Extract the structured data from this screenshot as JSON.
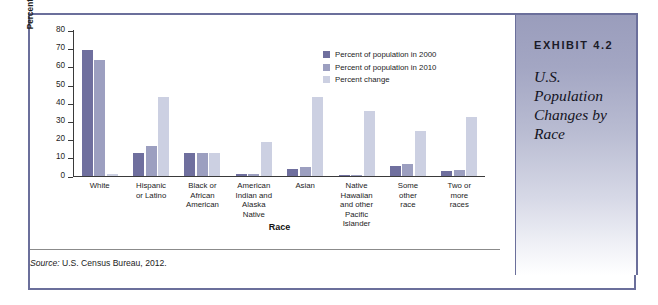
{
  "exhibit": {
    "number": "EXHIBIT 4.2",
    "title": "U.S. Population Changes by Race"
  },
  "source": {
    "keyword": "Source:",
    "text": " U.S. Census Bureau, 2012."
  },
  "colors": {
    "series_2000": "#6f6f9e",
    "series_2010": "#9c9fc0",
    "series_change": "#ccd0e2",
    "frame_border": "#6b6f9b",
    "panel_top": "#9a9dbc",
    "axis": "#3a3a3a"
  },
  "chart_data": {
    "type": "bar",
    "title": "",
    "xlabel": "Race",
    "ylabel": "Percentage of population",
    "ylim": [
      0,
      80
    ],
    "yticks": [
      0,
      10,
      20,
      30,
      40,
      50,
      60,
      70,
      80
    ],
    "grid": false,
    "legend_position": "upper-right-inside",
    "categories": [
      "White",
      "Hispanic or Latino",
      "Black or African American",
      "American Indian and Alaska Native",
      "Asian",
      "Native Hawaiian and other Pacific Islander",
      "Some other race",
      "Two or more races"
    ],
    "category_lines": [
      [
        "White"
      ],
      [
        "Hispanic",
        "or Latino"
      ],
      [
        "Black or",
        "African",
        "American"
      ],
      [
        "American",
        "Indian and",
        "Alaska",
        "Native"
      ],
      [
        "Asian"
      ],
      [
        "Native",
        "Hawaiian",
        "and other",
        "Pacific",
        "Islander"
      ],
      [
        "Some",
        "other",
        "race"
      ],
      [
        "Two or",
        "more",
        "races"
      ]
    ],
    "series": [
      {
        "name": "Percent of population in 2000",
        "color": "#6f6f9e",
        "values": [
          69.1,
          12.5,
          12.3,
          0.9,
          3.6,
          0.1,
          5.5,
          2.4
        ]
      },
      {
        "name": "Percent of population in 2010",
        "color": "#9c9fc0",
        "values": [
          63.7,
          16.3,
          12.6,
          0.9,
          4.8,
          0.2,
          6.2,
          2.9
        ]
      },
      {
        "name": "Percent change",
        "color": "#ccd0e2",
        "values": [
          1.0,
          43.0,
          12.3,
          18.4,
          43.3,
          35.4,
          24.4,
          32.0
        ]
      }
    ]
  }
}
